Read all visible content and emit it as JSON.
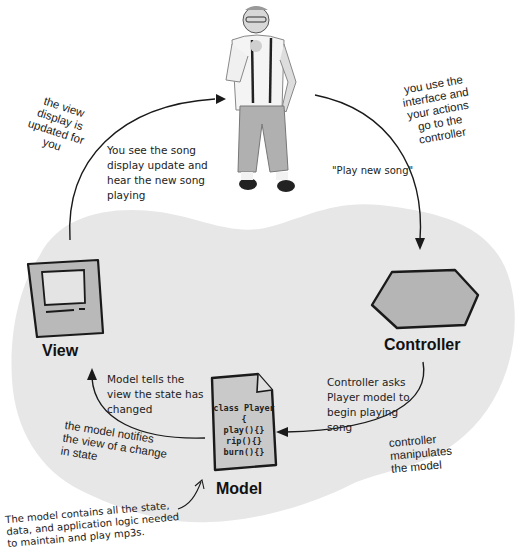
{
  "diagram": {
    "colors": {
      "background": "#ffffff",
      "blob": "#e6e6e6",
      "stroke": "#1a1a1a",
      "shape_fill": "#bdbdbd"
    },
    "user": {
      "description": "person standing (user)"
    },
    "components": {
      "view": {
        "label": "View",
        "icon": "computer-monitor-icon"
      },
      "controller": {
        "label": "Controller",
        "icon": "hexagon-icon"
      },
      "model": {
        "label": "Model",
        "icon": "document-icon",
        "code_lines": [
          "class Player {",
          "play(){}",
          "rip(){}",
          "burn(){}"
        ]
      }
    },
    "annotations": {
      "view_updated": [
        "the view",
        "display is",
        "updated for",
        "you"
      ],
      "see_song": [
        "You see the song",
        "display update and",
        "hear the new song",
        "playing"
      ],
      "use_interface": [
        "you use the",
        "interface and",
        "your actions",
        "go to the",
        "controller"
      ],
      "play_new_song": "\"Play new song\"",
      "model_tells_view": [
        "Model tells the",
        "view the state has",
        "changed"
      ],
      "model_notifies": [
        "the model  notifies",
        "the view of a change",
        "in state"
      ],
      "controller_asks": [
        "Controller asks",
        "Player model to",
        "begin playing",
        "song"
      ],
      "controller_manipulates": [
        "controller",
        "manipulates",
        "the model"
      ],
      "model_note": [
        "The model contains all the state,",
        "data, and application logic needed",
        "to maintain and play mp3s."
      ]
    }
  }
}
